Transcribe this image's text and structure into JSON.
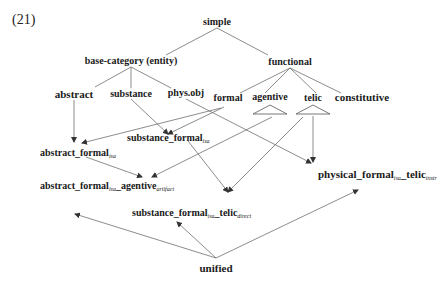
{
  "example_number": "(21)",
  "nodes": {
    "simple": "simple",
    "base_category": "base-category (entity)",
    "functional": "functional",
    "abstract": "abstract",
    "substance": "substance",
    "phys_obj": "phys.obj",
    "formal": "formal",
    "agentive": "agentive",
    "telic": "telic",
    "constitutive": "constitutive",
    "abstract_formal": {
      "main": "abstract_formal",
      "sub": "isa"
    },
    "substance_formal": {
      "main": "substance_formal",
      "sub": "isa"
    },
    "abstract_formal_agentive": {
      "p1": "abstract_formal",
      "s1": "isa",
      "p2": "_agentive",
      "s2": "artifact"
    },
    "substance_formal_telic": {
      "p1": "substance_formal",
      "s1": "isa",
      "p2": "_telic",
      "s2": "direct"
    },
    "physical_formal_telic": {
      "p1": "physical_formal",
      "s1": "isa",
      "p2": "_telic",
      "s2": "instr"
    },
    "unified": "unified"
  },
  "colors": {
    "text": "#1a1a1a",
    "edge": "#6e6e6e",
    "background": "#ffffff"
  }
}
